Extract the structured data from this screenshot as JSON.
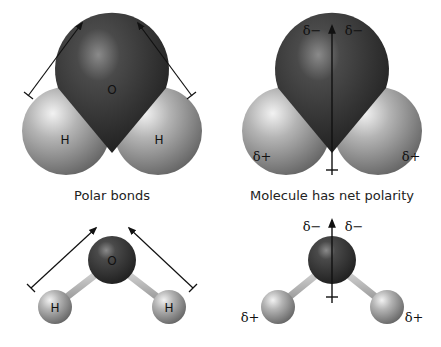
{
  "panels": {
    "top_left": {
      "caption": "Polar bonds",
      "atoms": {
        "o": "O",
        "h1": "H",
        "h2": "H"
      }
    },
    "top_right": {
      "caption": "Molecule has net polarity",
      "deltas": {
        "neg1": "δ−",
        "neg2": "δ−",
        "pos1": "δ+",
        "pos2": "δ+"
      }
    },
    "bottom_left": {
      "atoms": {
        "o": "O",
        "h1": "H",
        "h2": "H"
      }
    },
    "bottom_right": {
      "deltas": {
        "neg1": "δ−",
        "neg2": "δ−",
        "pos1": "δ+",
        "pos2": "δ+"
      }
    }
  },
  "colors": {
    "oxygen": "#3a3a3a",
    "hydrogen": "#a8a8a8",
    "background": "#ffffff",
    "arrow": "#111111"
  }
}
